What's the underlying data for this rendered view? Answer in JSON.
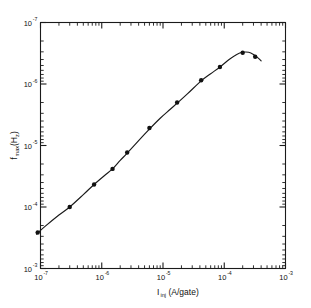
{
  "chart_data": {
    "type": "line",
    "title": "",
    "xlabel": "I_inj (A/gate)",
    "xlabel_main": "I",
    "xlabel_sub": "inj",
    "xlabel_rest": " (A/gate)",
    "ylabel": "f_max(Hz)",
    "ylabel_main": "f",
    "ylabel_sub": "max",
    "ylabel_rest": "(H",
    "ylabel_sub2": "z",
    "ylabel_end": ")",
    "xscale": "log",
    "yscale": "log",
    "y_inverted": true,
    "xlim": [
      1e-07,
      0.001
    ],
    "ylim": [
      1e-07,
      0.001
    ],
    "grid": false,
    "legend": null,
    "x_tick_labels": [
      "10-7",
      "10-6",
      "10-5",
      "10-4",
      "10-3"
    ],
    "x_tick_bases": [
      "10",
      "10",
      "10",
      "10",
      "10"
    ],
    "x_tick_exponents": [
      "-7",
      "-6",
      "-5",
      "-4",
      "-3"
    ],
    "x_tick_values": [
      1e-07,
      1e-06,
      1e-05,
      0.0001,
      0.001
    ],
    "y_tick_bases": [
      "10",
      "10",
      "10",
      "10",
      "10"
    ],
    "y_tick_exponents": [
      "-7",
      "-6",
      "-5",
      "-4",
      "-3"
    ],
    "y_tick_values": [
      1e-07,
      1e-06,
      1e-05,
      0.0001,
      0.001
    ],
    "series": [
      {
        "name": "fmax vs Iinj",
        "marker": "filled-circle",
        "line": "solid",
        "x": [
          9e-08,
          3e-07,
          7.5e-07,
          1.5e-06,
          2.6e-06,
          6e-06,
          1.7e-05,
          4.2e-05,
          8.5e-05,
          0.0002,
          0.00032
        ],
        "y": [
          0.00026,
          0.0001,
          4.3e-05,
          2.4e-05,
          1.3e-05,
          5.2e-06,
          2e-06,
          8.7e-07,
          5.3e-07,
          3.1e-07,
          3.6e-07
        ]
      }
    ],
    "curve": [
      [
        8.6e-08,
        0.000275
      ],
      [
        1.2e-07,
        0.000205
      ],
      [
        2e-07,
        0.000135
      ],
      [
        3e-07,
        0.0001
      ],
      [
        5e-07,
        6.3e-05
      ],
      [
        7.5e-07,
        4.3e-05
      ],
      [
        1.1e-06,
        3.1e-05
      ],
      [
        1.5e-06,
        2.4e-05
      ],
      [
        2e-06,
        1.75e-05
      ],
      [
        2.6e-06,
        1.33e-05
      ],
      [
        4e-06,
        8.3e-06
      ],
      [
        6e-06,
        5.4e-06
      ],
      [
        9e-06,
        3.6e-06
      ],
      [
        1.3e-05,
        2.6e-06
      ],
      [
        1.7e-05,
        2.05e-06
      ],
      [
        2.5e-05,
        1.45e-06
      ],
      [
        4.2e-05,
        8.9e-07
      ],
      [
        6e-05,
        6.8e-07
      ],
      [
        8.5e-05,
        5.3e-07
      ],
      [
        0.00012,
        4e-07
      ],
      [
        0.00016,
        3.3e-07
      ],
      [
        0.0002,
        3.05e-07
      ],
      [
        0.00025,
        3.05e-07
      ],
      [
        0.0003,
        3.3e-07
      ],
      [
        0.00036,
        3.8e-07
      ],
      [
        0.0004,
        4.2e-07
      ]
    ]
  },
  "figure": {
    "background_color": "#ffffff",
    "axis_color": "#1a1a1a",
    "line_color": "#1a1a1a",
    "marker_color": "#111111"
  }
}
